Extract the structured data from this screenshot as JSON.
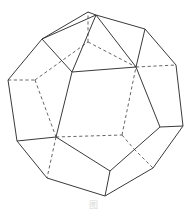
{
  "figure": {
    "caption": "图",
    "colors": {
      "background": "#ffffff",
      "edge": "#3a3a3a",
      "hidden_edge": "#555555"
    },
    "vertices": {
      "A": [
        88,
        12
      ],
      "B": [
        96,
        15
      ],
      "C": [
        42,
        39
      ],
      "D": [
        8,
        80
      ],
      "E": [
        17,
        141
      ],
      "F": [
        47,
        178
      ],
      "G": [
        105,
        196
      ],
      "H": [
        153,
        168
      ],
      "I": [
        183,
        126
      ],
      "J": [
        176,
        65
      ],
      "K": [
        145,
        29
      ],
      "L": [
        72,
        72
      ],
      "M": [
        136,
        67
      ],
      "N": [
        56,
        137
      ],
      "O": [
        110,
        171
      ],
      "P": [
        160,
        127
      ],
      "Q": [
        35,
        80
      ],
      "R": [
        88,
        42
      ],
      "S": [
        122,
        135
      ],
      "T": [
        134,
        149
      ],
      "U": [
        55,
        140
      ],
      "V": [
        45,
        176
      ]
    },
    "solid_edges": [
      [
        "A",
        "B"
      ],
      [
        "A",
        "C"
      ],
      [
        "B",
        "C"
      ],
      [
        "B",
        "K"
      ],
      [
        "C",
        "D"
      ],
      [
        "D",
        "E"
      ],
      [
        "E",
        "F"
      ],
      [
        "F",
        "G"
      ],
      [
        "G",
        "H"
      ],
      [
        "H",
        "I"
      ],
      [
        "I",
        "J"
      ],
      [
        "J",
        "K"
      ],
      [
        "C",
        "L"
      ],
      [
        "B",
        "L"
      ],
      [
        "B",
        "M"
      ],
      [
        "L",
        "M"
      ],
      [
        "L",
        "N"
      ],
      [
        "M",
        "P"
      ],
      [
        "N",
        "E"
      ],
      [
        "N",
        "O"
      ],
      [
        "O",
        "P"
      ],
      [
        "O",
        "G"
      ],
      [
        "P",
        "I"
      ],
      [
        "K",
        "M"
      ]
    ],
    "dashed_edges": [
      [
        "D",
        "Q"
      ],
      [
        "Q",
        "R"
      ],
      [
        "R",
        "A"
      ],
      [
        "R",
        "M"
      ],
      [
        "Q",
        "N"
      ],
      [
        "N",
        "S"
      ],
      [
        "S",
        "M"
      ],
      [
        "S",
        "T"
      ],
      [
        "T",
        "H"
      ],
      [
        "M",
        "J"
      ],
      [
        "N",
        "F"
      ]
    ]
  }
}
